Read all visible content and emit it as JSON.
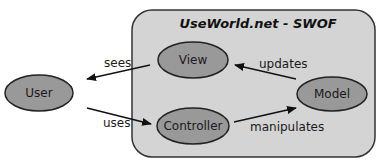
{
  "diagram": {
    "type": "mvc-architecture",
    "container": {
      "title": "UseWorld.net - SWOF",
      "fill": "#d4d4d4",
      "stroke": "#333333"
    },
    "node_fill": "#999999",
    "node_stroke": "#222222",
    "nodes": [
      {
        "id": "user",
        "label": "User"
      },
      {
        "id": "view",
        "label": "View"
      },
      {
        "id": "controller",
        "label": "Controller"
      },
      {
        "id": "model",
        "label": "Model"
      }
    ],
    "edges": [
      {
        "from": "view",
        "to": "user",
        "label": "sees"
      },
      {
        "from": "user",
        "to": "controller",
        "label": "uses"
      },
      {
        "from": "model",
        "to": "view",
        "label": "updates"
      },
      {
        "from": "controller",
        "to": "model",
        "label": "manipulates"
      }
    ]
  }
}
